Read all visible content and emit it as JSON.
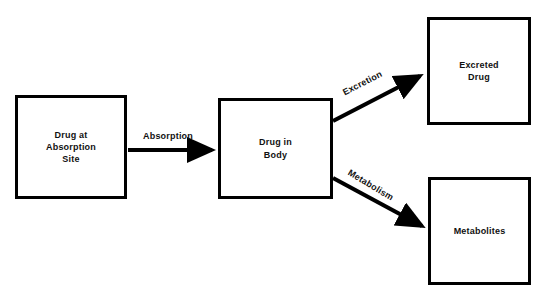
{
  "diagram": {
    "background_color": "#ffffff",
    "line_color": "#000000",
    "nodes": [
      {
        "id": "absorption_site",
        "label": "Drug at\nAbsorption\nSite"
      },
      {
        "id": "drug_in_body",
        "label": "Drug in\nBody"
      },
      {
        "id": "excreted_drug",
        "label": "Excreted\nDrug"
      },
      {
        "id": "metabolites",
        "label": "Metabolites"
      }
    ],
    "edges": [
      {
        "id": "absorption",
        "label": "Absorption",
        "from": "absorption_site",
        "to": "drug_in_body"
      },
      {
        "id": "excretion",
        "label": "Excretion",
        "from": "drug_in_body",
        "to": "excreted_drug"
      },
      {
        "id": "metabolism",
        "label": "Metabolism",
        "from": "drug_in_body",
        "to": "metabolites"
      }
    ]
  }
}
